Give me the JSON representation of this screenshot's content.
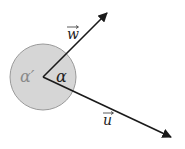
{
  "diagram": {
    "type": "vector-angle",
    "colors": {
      "background": "#ffffff",
      "circle_fill": "#d6d6d6",
      "circle_stroke": "#9a9a9a",
      "vector": "#1a1a1a",
      "label_dark": "#222222",
      "label_gray": "#8a8a8a"
    },
    "origin": {
      "x": 43,
      "y": 77
    },
    "circle_radius": 33,
    "vectors": [
      {
        "name": "w",
        "label": "w",
        "tip": {
          "x": 108,
          "y": 12
        }
      },
      {
        "name": "u",
        "label": "u",
        "tip": {
          "x": 172,
          "y": 138
        }
      }
    ],
    "angles": {
      "inner": "α",
      "outer": "α′"
    }
  }
}
